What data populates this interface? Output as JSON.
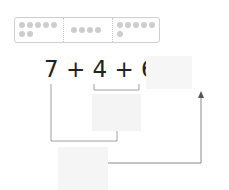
{
  "dot_groups": [
    {
      "count": 7,
      "rows": [
        5,
        2
      ]
    },
    {
      "count": 4,
      "rows": [
        4
      ]
    },
    {
      "count": 6,
      "rows": [
        5,
        1
      ]
    }
  ],
  "equation": {
    "text": "7 + 4 + 6 =",
    "terms": [
      "7",
      "4",
      "6"
    ],
    "operators": [
      "+",
      "+",
      "="
    ]
  },
  "answer_box": {
    "value": ""
  },
  "partial_sum_box": {
    "value": ""
  },
  "total_box": {
    "value": ""
  },
  "colors": {
    "line": "#9a9a9a",
    "dot": "#cdcdcd",
    "box": "#f5f5f5",
    "text": "#222222"
  }
}
